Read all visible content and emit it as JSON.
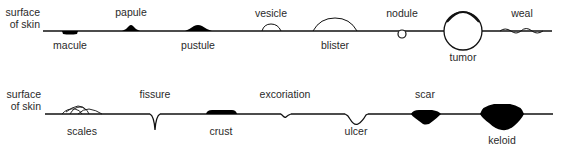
{
  "row1": {
    "surface_label_line1": "surface",
    "surface_label_line2": "of skin",
    "lesions": {
      "macule": "macule",
      "papule": "papule",
      "pustule": "pustule",
      "vesicle": "vesicle",
      "blister": "blister",
      "nodule": "nodule",
      "tumor": "tumor",
      "weal": "weal"
    }
  },
  "row2": {
    "surface_label_line1": "surface",
    "surface_label_line2": "of skin",
    "lesions": {
      "scales": "scales",
      "fissure": "fissure",
      "crust": "crust",
      "excoriation": "excoriation",
      "ulcer": "ulcer",
      "scar": "scar",
      "keloid": "keloid"
    }
  },
  "colors": {
    "line": "#111111",
    "fill": "#000000",
    "text": "#2a2a2a"
  }
}
